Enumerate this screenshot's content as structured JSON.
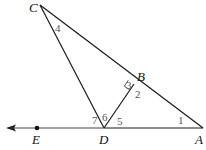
{
  "points": {
    "C": {
      "label": "C",
      "x": 40,
      "y": 5
    },
    "B": {
      "label": "B",
      "x": 134,
      "y": 84
    },
    "A": {
      "label": "A",
      "x": 203,
      "y": 128
    },
    "D": {
      "label": "D",
      "x": 104,
      "y": 128
    },
    "E": {
      "label": "E",
      "x": 37,
      "y": 128
    }
  },
  "angles": {
    "a1": "1",
    "a2": "2",
    "a3": "3",
    "a4": "4",
    "a5": "5",
    "a6": "6",
    "a7": "7"
  },
  "colors": {
    "line": "#1a1a1a",
    "ray": "#444444",
    "angle_label": "#555555"
  }
}
